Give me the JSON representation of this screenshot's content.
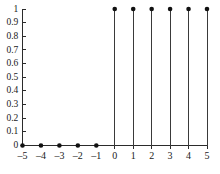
{
  "chart_data": {
    "type": "scatter",
    "plot_style": "stem",
    "title": "",
    "subtitle": "",
    "xlabel": "",
    "ylabel": "",
    "x": [
      -5,
      -4,
      -3,
      -2,
      -1,
      0,
      1,
      2,
      3,
      4,
      5
    ],
    "values": [
      0,
      0,
      0,
      0,
      0,
      1,
      1,
      1,
      1,
      1,
      1
    ],
    "series": [
      {
        "name": "",
        "values": [
          0,
          0,
          0,
          0,
          0,
          1,
          1,
          1,
          1,
          1,
          1
        ]
      }
    ],
    "xlim": [
      -5,
      5
    ],
    "ylim": [
      0,
      1
    ],
    "x_tick_labels": [
      "–5",
      "–4",
      "–3",
      "–2",
      "–1",
      "0",
      "1",
      "2",
      "3",
      "4",
      "5"
    ],
    "x_tick_values": [
      -5,
      -4,
      -3,
      -2,
      -1,
      0,
      1,
      2,
      3,
      4,
      5
    ],
    "y_tick_labels": [
      "0",
      "0.1",
      "0.2",
      "0.3",
      "0.4",
      "0.5",
      "0.6",
      "0.7",
      "0.8",
      "0.9",
      "1"
    ],
    "y_tick_values": [
      0,
      0.1,
      0.2,
      0.3,
      0.4,
      0.5,
      0.6,
      0.7,
      0.8,
      0.9,
      1
    ],
    "grid": false,
    "legend": false,
    "legend_position": "none",
    "marker": "filled-circle",
    "line_color": "#3a3a3a",
    "marker_color": "#111111",
    "axis_color": "#2b2b2b",
    "background_color": "#ffffff",
    "annotations": []
  }
}
